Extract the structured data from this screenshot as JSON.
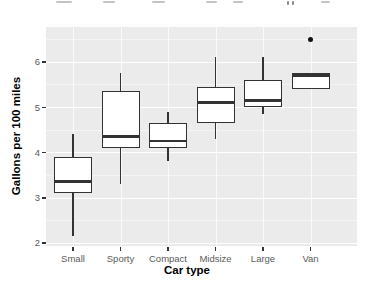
{
  "chart_data": {
    "type": "boxplot",
    "title": "",
    "xlabel": "Car type",
    "ylabel": "Gallons per 100 miles",
    "categories": [
      "Small",
      "Sporty",
      "Compact",
      "Midsize",
      "Large",
      "Van"
    ],
    "yticks": [
      2,
      3,
      4,
      5,
      6
    ],
    "ylim": [
      1.93,
      6.77
    ],
    "grid": "major white on gray panel, ggplot2 theme_gray",
    "legend": "none",
    "series": [
      {
        "category": "Small",
        "min": 2.15,
        "q1": 3.1,
        "median": 3.35,
        "q3": 3.9,
        "max": 4.4,
        "outliers": []
      },
      {
        "category": "Sporty",
        "min": 3.3,
        "q1": 4.1,
        "median": 4.35,
        "q3": 5.35,
        "max": 5.75,
        "outliers": []
      },
      {
        "category": "Compact",
        "min": 3.8,
        "q1": 4.1,
        "median": 4.25,
        "q3": 4.65,
        "max": 4.9,
        "outliers": []
      },
      {
        "category": "Midsize",
        "min": 4.3,
        "q1": 4.65,
        "median": 5.1,
        "q3": 5.45,
        "max": 6.1,
        "outliers": []
      },
      {
        "category": "Large",
        "min": 4.85,
        "q1": 5.0,
        "median": 5.15,
        "q3": 5.6,
        "max": 6.1,
        "outliers": []
      },
      {
        "category": "Van",
        "min": 5.4,
        "q1": 5.4,
        "median": 5.7,
        "q3": 5.75,
        "max": 5.75,
        "outliers": [
          6.5
        ]
      }
    ],
    "colors": {
      "panel_bg": "#ebebeb",
      "grid_major": "#ffffff",
      "grid_minor": "#f4f4f4",
      "box_border": "#333333",
      "box_fill": "#ffffff",
      "axis_text": "#5a5a5a",
      "axis_title": "#000000",
      "outlier": "#111111"
    }
  }
}
